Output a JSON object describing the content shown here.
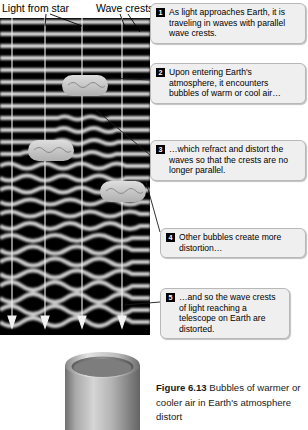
{
  "labels": {
    "light_from_star": "Light from star",
    "wave_crests": "Wave crests"
  },
  "callouts": [
    {
      "number": "1",
      "text": "As light approaches Earth, it is traveling in waves with parallel wave crests."
    },
    {
      "number": "2",
      "text": "Upon entering Earth's atmosphere, it encounters bubbles of warm or cool air…"
    },
    {
      "number": "3",
      "text": "…which refract and distort the waves so that the crests are no longer parallel."
    },
    {
      "number": "4",
      "text": "Other bubbles create more distortion…"
    },
    {
      "number": "5",
      "text": "…and so the wave crests of light reaching a telescope on Earth are distorted."
    }
  ],
  "caption": {
    "figure_number": "Figure 6.13",
    "body": " Bubbles of warmer or cooler air in Earth's atmosphere distort"
  },
  "colors": {
    "diagram_background": "#000000",
    "wave_band": "#d8d8d8",
    "bubble_fill": "#c9c9c9",
    "ray_line": "#f2f2f2",
    "callout_fill": "#efefef",
    "callout_border": "#b8b8b8",
    "badge_fill": "#000000",
    "telescope_body": "#9a9a9a"
  }
}
